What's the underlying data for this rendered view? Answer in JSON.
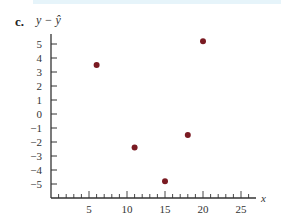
{
  "part_label": "c.",
  "chart_data": {
    "type": "scatter",
    "title": "",
    "xlabel": "x",
    "ylabel": "y − ŷ",
    "xlim": [
      0,
      27
    ],
    "ylim": [
      -6,
      6
    ],
    "x_ticks": [
      5,
      10,
      15,
      20,
      25
    ],
    "y_ticks": [
      5,
      4,
      3,
      2,
      1,
      0,
      -1,
      -2,
      -3,
      -4,
      -5
    ],
    "grid": false,
    "points": [
      {
        "x": 6,
        "y": 3.5
      },
      {
        "x": 11,
        "y": -2.4
      },
      {
        "x": 15,
        "y": -4.8
      },
      {
        "x": 18,
        "y": -1.5
      },
      {
        "x": 20,
        "y": 5.2
      }
    ],
    "point_color": "#7a1a22",
    "axis_color": "#333333"
  }
}
